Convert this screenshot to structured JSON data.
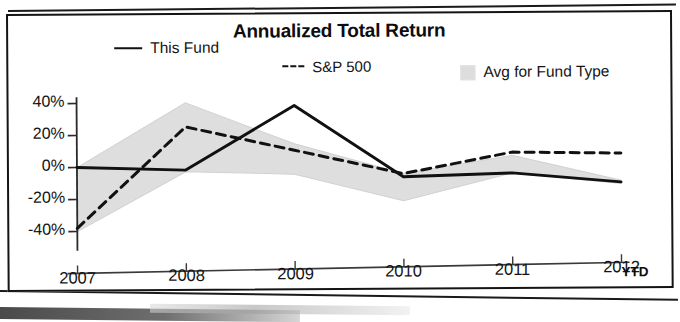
{
  "chart_data": {
    "type": "line",
    "title": "Annualized Total Return",
    "xlabel": "",
    "ylabel": "",
    "categories": [
      "2007",
      "2008",
      "2009",
      "2010",
      "2011",
      "2012"
    ],
    "x_axis_note": "YTD",
    "ylim": [
      -52,
      48
    ],
    "yticks": [
      40,
      20,
      0,
      -20,
      -40
    ],
    "ytick_labels": [
      "40%",
      "20%",
      "0%",
      "-20%",
      "-40%"
    ],
    "grid": false,
    "legend_position": "top",
    "series": [
      {
        "name": "This Fund",
        "style": "solid",
        "color": "#111111",
        "values": [
          0,
          -2,
          38,
          -7,
          -5,
          -11
        ]
      },
      {
        "name": "S&P 500",
        "style": "dashed",
        "color": "#111111",
        "values": [
          -38,
          25,
          10,
          -5,
          8,
          7
        ]
      },
      {
        "name": "Avg for Fund Type",
        "style": "band",
        "color": "#dddddd",
        "upper": [
          0,
          40,
          14,
          -5,
          6,
          -10
        ],
        "lower": [
          -40,
          -3,
          -5,
          -22,
          -5,
          -12
        ]
      }
    ]
  },
  "chart": {
    "title": "Annualized Total Return",
    "legend": [
      {
        "label": "This Fund",
        "marker": "solid-line-swatch"
      },
      {
        "label": "S&P 500",
        "marker": "dashed-line-swatch"
      },
      {
        "label": "Avg for Fund Type",
        "marker": "gray-band-swatch"
      }
    ],
    "y_axis": {
      "labels": [
        "40%",
        "20%",
        "0%",
        "-20%",
        "-40%"
      ]
    },
    "x_axis": {
      "labels": [
        "2007",
        "2008",
        "2009",
        "2010",
        "2011",
        "2012"
      ],
      "suffix": "YTD"
    }
  }
}
